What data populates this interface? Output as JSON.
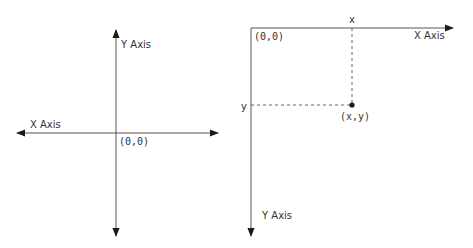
{
  "diagrams": {
    "cartesian": {
      "title": "Cartesian coordinate system",
      "y_axis_label": "Y Axis",
      "x_axis_label": "X Axis",
      "origin_label": "(0,0)"
    },
    "screen": {
      "title": "Screen coordinate system",
      "origin_label": "(0,0)",
      "x_axis_label": "X Axis",
      "y_axis_label": "Y Axis",
      "x_marker_label": "x",
      "y_marker_label": "y",
      "point_label": "(x,y)"
    }
  },
  "colors": {
    "axis": "#1a1a1a",
    "dashed": "#666666",
    "text": "#333333",
    "background": "#ffffff"
  }
}
